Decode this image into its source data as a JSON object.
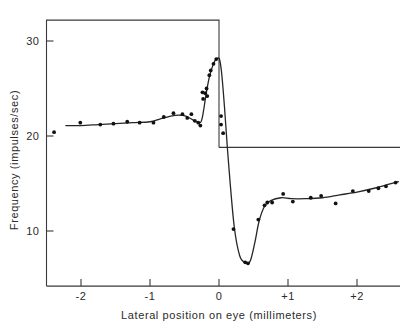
{
  "chart_data": {
    "type": "scatter",
    "title": "",
    "xlabel": "Lateral position on eye (millimeters)",
    "ylabel": "Frequency (impulses/sec)",
    "xlim": [
      -2.55,
      2.65
    ],
    "ylim": [
      4.2,
      32.2
    ],
    "xticks": [
      -2,
      -1,
      0,
      1,
      2
    ],
    "xticklabels": [
      "-2",
      "-1",
      "0",
      "+1",
      "+2"
    ],
    "yticks": [
      10,
      20,
      30
    ],
    "yticklabels": [
      "10",
      "20",
      "30"
    ],
    "grid": false,
    "legend": null,
    "series": [
      {
        "name": "Measured firing frequency",
        "marker": "filled-circle",
        "points": [
          {
            "x": -2.39,
            "y": 20.4
          },
          {
            "x": -2.01,
            "y": 21.4
          },
          {
            "x": -1.72,
            "y": 21.2
          },
          {
            "x": -1.53,
            "y": 21.3
          },
          {
            "x": -1.33,
            "y": 21.5
          },
          {
            "x": -1.15,
            "y": 21.4
          },
          {
            "x": -0.95,
            "y": 21.4
          },
          {
            "x": -0.8,
            "y": 22.0
          },
          {
            "x": -0.66,
            "y": 22.4
          },
          {
            "x": -0.53,
            "y": 22.3
          },
          {
            "x": -0.46,
            "y": 21.9
          },
          {
            "x": -0.4,
            "y": 22.3
          },
          {
            "x": -0.35,
            "y": 21.6
          },
          {
            "x": -0.3,
            "y": 21.4
          },
          {
            "x": -0.27,
            "y": 21.1
          },
          {
            "x": -0.24,
            "y": 24.6
          },
          {
            "x": -0.23,
            "y": 23.9
          },
          {
            "x": -0.2,
            "y": 24.5
          },
          {
            "x": -0.18,
            "y": 25.0
          },
          {
            "x": -0.17,
            "y": 24.2
          },
          {
            "x": -0.14,
            "y": 26.4
          },
          {
            "x": -0.12,
            "y": 26.9
          },
          {
            "x": -0.08,
            "y": 27.6
          },
          {
            "x": -0.04,
            "y": 28.1
          },
          {
            "x": 0.03,
            "y": 22.1
          },
          {
            "x": 0.03,
            "y": 21.2
          },
          {
            "x": 0.06,
            "y": 20.3
          },
          {
            "x": 0.21,
            "y": 10.2
          },
          {
            "x": 0.38,
            "y": 6.7
          },
          {
            "x": 0.42,
            "y": 6.6
          },
          {
            "x": 0.57,
            "y": 11.2
          },
          {
            "x": 0.66,
            "y": 12.7
          },
          {
            "x": 0.7,
            "y": 13.0
          },
          {
            "x": 0.77,
            "y": 13.0
          },
          {
            "x": 0.93,
            "y": 13.9
          },
          {
            "x": 1.07,
            "y": 13.1
          },
          {
            "x": 1.33,
            "y": 13.5
          },
          {
            "x": 1.48,
            "y": 13.7
          },
          {
            "x": 1.69,
            "y": 12.9
          },
          {
            "x": 1.94,
            "y": 14.2
          },
          {
            "x": 2.17,
            "y": 14.2
          },
          {
            "x": 2.31,
            "y": 14.5
          },
          {
            "x": 2.42,
            "y": 14.7
          },
          {
            "x": 2.56,
            "y": 15.1
          }
        ]
      }
    ],
    "fitted_curve": {
      "name": "Smoothed fit",
      "points": [
        {
          "x": -2.22,
          "y": 21.1
        },
        {
          "x": -2.0,
          "y": 21.1
        },
        {
          "x": -1.75,
          "y": 21.2
        },
        {
          "x": -1.5,
          "y": 21.3
        },
        {
          "x": -1.25,
          "y": 21.4
        },
        {
          "x": -1.0,
          "y": 21.5
        },
        {
          "x": -0.85,
          "y": 21.8
        },
        {
          "x": -0.7,
          "y": 22.1
        },
        {
          "x": -0.58,
          "y": 22.2
        },
        {
          "x": -0.48,
          "y": 22.1
        },
        {
          "x": -0.38,
          "y": 21.7
        },
        {
          "x": -0.3,
          "y": 21.4
        },
        {
          "x": -0.26,
          "y": 21.5
        },
        {
          "x": -0.23,
          "y": 22.4
        },
        {
          "x": -0.2,
          "y": 23.8
        },
        {
          "x": -0.17,
          "y": 25.1
        },
        {
          "x": -0.14,
          "y": 26.2
        },
        {
          "x": -0.1,
          "y": 27.2
        },
        {
          "x": -0.06,
          "y": 27.9
        },
        {
          "x": -0.02,
          "y": 28.2
        },
        {
          "x": 0.01,
          "y": 28.0
        },
        {
          "x": 0.04,
          "y": 26.5
        },
        {
          "x": 0.08,
          "y": 23.0
        },
        {
          "x": 0.14,
          "y": 17.0
        },
        {
          "x": 0.22,
          "y": 10.5
        },
        {
          "x": 0.3,
          "y": 7.4
        },
        {
          "x": 0.38,
          "y": 6.7
        },
        {
          "x": 0.45,
          "y": 6.8
        },
        {
          "x": 0.52,
          "y": 8.8
        },
        {
          "x": 0.58,
          "y": 11.0
        },
        {
          "x": 0.66,
          "y": 12.6
        },
        {
          "x": 0.75,
          "y": 13.2
        },
        {
          "x": 0.9,
          "y": 13.5
        },
        {
          "x": 1.05,
          "y": 13.4
        },
        {
          "x": 1.25,
          "y": 13.4
        },
        {
          "x": 1.5,
          "y": 13.5
        },
        {
          "x": 1.75,
          "y": 13.8
        },
        {
          "x": 2.0,
          "y": 14.1
        },
        {
          "x": 2.25,
          "y": 14.5
        },
        {
          "x": 2.45,
          "y": 14.9
        },
        {
          "x": 2.6,
          "y": 15.2
        }
      ]
    },
    "frame": {
      "description": "Partial plot box: left spine and top spine span only the left portion; a vertical spine descends at x=0 to a horizontal baseline that continues to the right edge.",
      "left_spine_x": -2.5,
      "top_spine_y": 32.2,
      "inner_right_spine_x": 0.0,
      "baseline_y": 18.8,
      "bottom_axis_y": 4.2
    }
  }
}
